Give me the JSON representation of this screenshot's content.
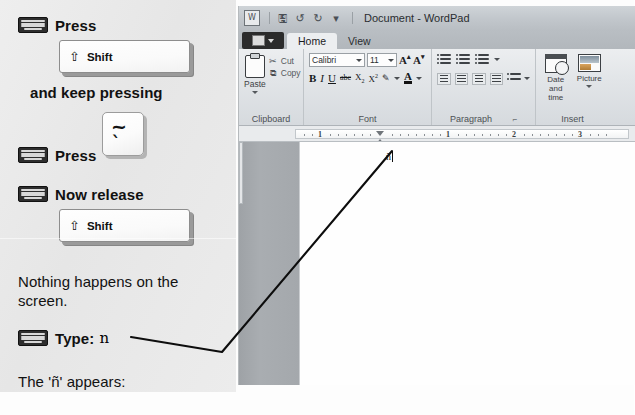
{
  "instructions": {
    "step1": {
      "label": "Press",
      "key": {
        "modifier_symbol": "⇧",
        "name": "Shift"
      }
    },
    "note1": "and keep pressing",
    "step2": {
      "label": "Press",
      "key": {
        "top_symbol": "~",
        "bottom_symbol": "`"
      }
    },
    "step3": {
      "label": "Now release",
      "key": {
        "modifier_symbol": "⇧",
        "name": "Shift"
      }
    },
    "note2": "Nothing happens on the\nscreen.",
    "note2_line1": "Nothing happens on the",
    "note2_line2": "screen.",
    "step4": {
      "label": "Type:",
      "value": "n"
    },
    "note3": "The 'ñ' appears:"
  },
  "wordpad": {
    "title": "Document - WordPad",
    "quick_access": [
      {
        "icon": "wordpad-app-icon",
        "label": ""
      },
      {
        "icon": "save-icon",
        "label": ""
      },
      {
        "icon": "undo-icon",
        "label": ""
      },
      {
        "icon": "redo-icon",
        "label": ""
      },
      {
        "icon": "chevron-down-icon",
        "label": ""
      }
    ],
    "app_button": "File",
    "tabs": [
      {
        "label": "Home",
        "active": true
      },
      {
        "label": "View",
        "active": false
      }
    ],
    "groups": {
      "clipboard": {
        "label": "Clipboard",
        "paste": "Paste",
        "cut": "Cut",
        "copy": "Copy"
      },
      "font": {
        "label": "Font",
        "family": "Calibri",
        "size": "11",
        "grow": "A",
        "shrink": "A",
        "bold": "B",
        "italic": "I",
        "underline": "U",
        "strikethrough": "abc",
        "subscript": "X",
        "superscript": "X",
        "highlight": "highlight-icon",
        "color": "A"
      },
      "paragraph": {
        "label": "Paragraph",
        "dialog_launcher": "⌐",
        "decrease_indent": "decrease-indent-icon",
        "increase_indent": "increase-indent-icon",
        "bullets": "bullets-icon",
        "align_left": "align-left-icon",
        "align_center": "align-center-icon",
        "align_right": "align-right-icon",
        "align_justify": "align-justify-icon",
        "line_spacing": "line-spacing-icon"
      },
      "insert": {
        "label": "Insert",
        "date_and_time_line1": "Date and",
        "date_and_time_line2": "time",
        "picture": "Picture"
      }
    },
    "ruler": {
      "numbers": [
        "1",
        "1",
        "2",
        "3"
      ]
    },
    "document": {
      "text": "ñ"
    }
  }
}
